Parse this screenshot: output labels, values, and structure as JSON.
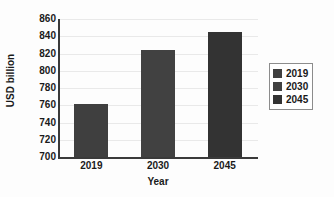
{
  "chart_data": {
    "type": "bar",
    "title": "",
    "subtitle": "",
    "xlabel": "Year",
    "ylabel": "USD billion",
    "categories": [
      "2019",
      "2030",
      "2045"
    ],
    "values": [
      761,
      824,
      845
    ],
    "series": [
      {
        "name": "2019",
        "values": [
          761,
          null,
          null
        ],
        "color": "#3f3f3f"
      },
      {
        "name": "2030",
        "values": [
          null,
          824,
          null
        ],
        "color": "#414141"
      },
      {
        "name": "2045",
        "values": [
          null,
          null,
          845
        ],
        "color": "#333333"
      }
    ],
    "ylim": [
      700,
      860
    ],
    "ytick_values": [
      700,
      720,
      740,
      760,
      780,
      800,
      820,
      840,
      860
    ],
    "ytick_labels": [
      "700",
      "720",
      "740",
      "760",
      "780",
      "800",
      "820",
      "840",
      "860"
    ],
    "xtick_labels": [
      "2019",
      "2030",
      "2045"
    ],
    "grid": true,
    "grid_axis": "y",
    "grid_color": "#e9e9e9",
    "legend": {
      "position": "right",
      "bordered": true,
      "entries": [
        {
          "label": "2019",
          "color": "#3f3f3f"
        },
        {
          "label": "2030",
          "color": "#414141"
        },
        {
          "label": "2045",
          "color": "#333333"
        }
      ]
    },
    "bar_colors": [
      "#3f3f3f",
      "#414141",
      "#333333"
    ],
    "axis_color": "#3a3a3a",
    "background_color": "#fdfdfd",
    "text_color": "#1a1a1a",
    "bar_width_px": 34,
    "data_labels_shown": false
  }
}
